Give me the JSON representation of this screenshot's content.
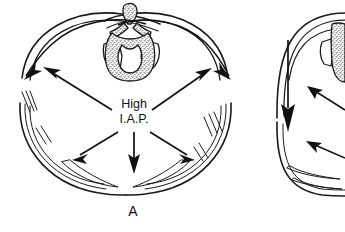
{
  "figure": {
    "background_color": "#ffffff",
    "ink_color": "#1a1a1a",
    "width": 345,
    "height": 232,
    "style": "black-and-white line drawing with stippled bone"
  },
  "center_label": {
    "line1": "High",
    "line2": "I.A.P."
  },
  "panels": [
    {
      "id": "A",
      "letter": "A",
      "description": "complete axial abdominal cross-section"
    },
    {
      "id": "B",
      "letter": "",
      "description": "partial axial cross-section cropped at right edge"
    }
  ],
  "anatomy": {
    "vertebra_label": "vertebra",
    "spinal_canal_label": "spinal canal",
    "abdominal_wall_label": "abdominal wall",
    "muscle_hatching_label": "muscle fibers"
  },
  "arrows": {
    "radial_count": 5,
    "curved_count": 2,
    "direction_note": "outward from high intra-abdominal pressure"
  }
}
